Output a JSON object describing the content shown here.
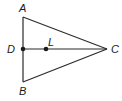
{
  "diagram": {
    "type": "geometry-triangle",
    "points": {
      "A": {
        "label": "A",
        "x": 23,
        "y": 17,
        "label_x": 19,
        "label_y": 12
      },
      "B": {
        "label": "B",
        "x": 23,
        "y": 82,
        "label_x": 19,
        "label_y": 95
      },
      "C": {
        "label": "C",
        "x": 107,
        "y": 49,
        "label_x": 111,
        "label_y": 53
      },
      "D": {
        "label": "D",
        "x": 23,
        "y": 49,
        "label_x": 7,
        "label_y": 53
      },
      "L": {
        "label": "L",
        "x": 46,
        "y": 49,
        "label_x": 48,
        "label_y": 46
      }
    },
    "segments": [
      {
        "from": "A",
        "to": "C"
      },
      {
        "from": "B",
        "to": "C"
      },
      {
        "from": "A",
        "to": "B"
      },
      {
        "from": "D",
        "to": "C"
      }
    ],
    "marked_points": [
      "D",
      "L"
    ],
    "stroke_color": "#2a2a2a",
    "background": "#ffffff"
  }
}
